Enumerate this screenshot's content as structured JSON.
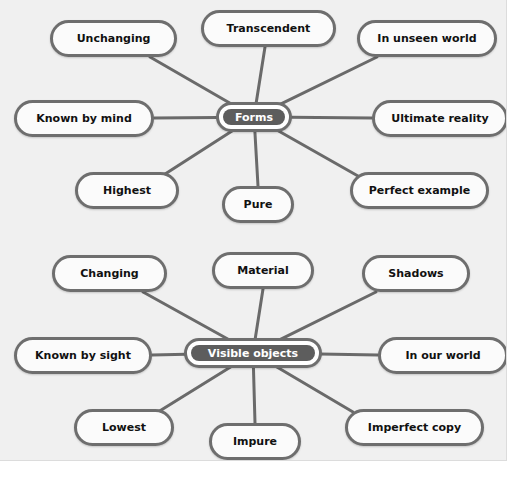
{
  "diagram": {
    "type": "concept-map",
    "colors": {
      "panel_background": "#f0f0f0",
      "page_background": "#ffffff",
      "node_fill": "#fbfbfb",
      "node_border": "#6e6e6e",
      "center_fill": "#5d5d5d",
      "center_text": "#ffffff",
      "leaf_text": "#111111",
      "edge": "#6a6a6a",
      "panel_border": "#dcdcdc"
    },
    "clusters": [
      {
        "id": "forms",
        "center": {
          "label": "Forms",
          "x": 216,
          "y": 102,
          "w": 76,
          "h": 30
        },
        "leaves": [
          {
            "id": "unchanging",
            "label": "Unchanging",
            "x": 50,
            "y": 20,
            "w": 127,
            "h": 37,
            "anchor_x": 150,
            "anchor_y": 57
          },
          {
            "id": "transcendent",
            "label": "Transcendent",
            "x": 201,
            "y": 10,
            "w": 135,
            "h": 37,
            "anchor_x": 265,
            "anchor_y": 47
          },
          {
            "id": "in-unseen-world",
            "label": "In unseen world",
            "x": 357,
            "y": 20,
            "w": 140,
            "h": 37,
            "anchor_x": 377,
            "anchor_y": 57
          },
          {
            "id": "known-by-mind",
            "label": "Known by mind",
            "x": 14,
            "y": 100,
            "w": 140,
            "h": 37,
            "anchor_x": 154,
            "anchor_y": 118
          },
          {
            "id": "ultimate-reality",
            "label": "Ultimate reality",
            "x": 372,
            "y": 100,
            "w": 136,
            "h": 37,
            "anchor_x": 372,
            "anchor_y": 118
          },
          {
            "id": "highest",
            "label": "Highest",
            "x": 75,
            "y": 172,
            "w": 104,
            "h": 37,
            "anchor_x": 162,
            "anchor_y": 176
          },
          {
            "id": "pure",
            "label": "Pure",
            "x": 222,
            "y": 186,
            "w": 72,
            "h": 37,
            "anchor_x": 258,
            "anchor_y": 186
          },
          {
            "id": "perfect-example",
            "label": "Perfect example",
            "x": 350,
            "y": 172,
            "w": 139,
            "h": 37,
            "anchor_x": 358,
            "anchor_y": 176
          }
        ]
      },
      {
        "id": "visible-objects",
        "center": {
          "label": "Visible objects",
          "x": 184,
          "y": 338,
          "w": 138,
          "h": 30
        },
        "leaves": [
          {
            "id": "changing",
            "label": "Changing",
            "x": 52,
            "y": 255,
            "w": 115,
            "h": 37,
            "anchor_x": 143,
            "anchor_y": 292
          },
          {
            "id": "material",
            "label": "Material",
            "x": 212,
            "y": 252,
            "w": 102,
            "h": 37,
            "anchor_x": 263,
            "anchor_y": 289
          },
          {
            "id": "shadows",
            "label": "Shadows",
            "x": 362,
            "y": 255,
            "w": 108,
            "h": 37,
            "anchor_x": 376,
            "anchor_y": 292
          },
          {
            "id": "known-by-sight",
            "label": "Known by sight",
            "x": 14,
            "y": 337,
            "w": 138,
            "h": 37,
            "anchor_x": 152,
            "anchor_y": 355
          },
          {
            "id": "in-our-world",
            "label": "In our world",
            "x": 378,
            "y": 337,
            "w": 130,
            "h": 37,
            "anchor_x": 378,
            "anchor_y": 355
          },
          {
            "id": "lowest",
            "label": "Lowest",
            "x": 74,
            "y": 409,
            "w": 100,
            "h": 37,
            "anchor_x": 158,
            "anchor_y": 412
          },
          {
            "id": "impure",
            "label": "Impure",
            "x": 209,
            "y": 423,
            "w": 92,
            "h": 37,
            "anchor_x": 255,
            "anchor_y": 423
          },
          {
            "id": "imperfect-copy",
            "label": "Imperfect copy",
            "x": 345,
            "y": 409,
            "w": 139,
            "h": 37,
            "anchor_x": 353,
            "anchor_y": 412
          }
        ]
      }
    ]
  }
}
